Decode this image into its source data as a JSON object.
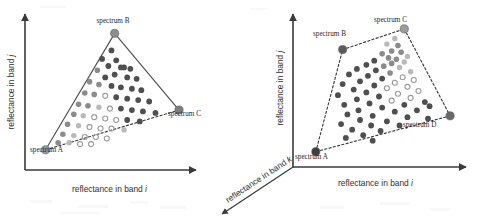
{
  "figure": {
    "background_color": "#ffffff",
    "axis_color": "#3a3a3a"
  },
  "panels": [
    {
      "id": "left",
      "name": "three-endmember-simplex",
      "axes": {
        "x_label_prefix": "reflectance in band ",
        "x_label_symbol": "i",
        "y_label_prefix": "reflectance in band ",
        "y_label_symbol": "j"
      },
      "endmembers": [
        {
          "label": "spectrum A",
          "x": 0.08,
          "y": 0.1,
          "color": "#9a9a9a"
        },
        {
          "label": "spectrum B",
          "x": 0.52,
          "y": 0.92,
          "color": "#8d8d8d"
        },
        {
          "label": "spectrum C",
          "x": 0.93,
          "y": 0.38,
          "color": "#7e7e7e"
        }
      ],
      "edge_style": [
        "solid",
        "solid",
        "dashed"
      ],
      "point_count": 55
    },
    {
      "id": "right",
      "name": "four-endmember-simplex",
      "axes": {
        "x_label_prefix": "reflectance in band ",
        "x_label_symbol": "i",
        "y_label_prefix": "reflectance in band ",
        "y_label_symbol": "j",
        "z_label_prefix": "reflectance in band ",
        "z_label_symbol": "k"
      },
      "endmembers": [
        {
          "label": "spectrum A",
          "x": 0.1,
          "y": 0.06,
          "color": "#3f3f3f"
        },
        {
          "label": "spectrum B",
          "x": 0.27,
          "y": 0.8,
          "color": "#5c5c5c"
        },
        {
          "label": "spectrum C",
          "x": 0.66,
          "y": 0.95,
          "color": "#9c9c9c"
        },
        {
          "label": "spectrum D",
          "x": 0.95,
          "y": 0.32,
          "color": "#6a6a6a"
        }
      ],
      "edge_style": [
        "dashed",
        "dashed",
        "dashed",
        "dashed"
      ],
      "point_count": 62
    }
  ],
  "chart_data": {
    "type": "scatter",
    "subplots": [
      {
        "name": "three-endmember simplex",
        "xlabel": "reflectance in band i",
        "ylabel": "reflectance in band j",
        "xlim": [
          0,
          1
        ],
        "ylim": [
          0,
          1
        ],
        "grid": false,
        "legend": "none",
        "annotations": [
          "spectrum A",
          "spectrum B",
          "spectrum C"
        ],
        "vertices": [
          {
            "name": "spectrum A",
            "x": 0.08,
            "y": 0.1
          },
          {
            "name": "spectrum B",
            "x": 0.52,
            "y": 0.92
          },
          {
            "name": "spectrum C",
            "x": 0.93,
            "y": 0.38
          }
        ],
        "points": [
          {
            "x": 0.5,
            "y": 0.8,
            "shade": "dark"
          },
          {
            "x": 0.44,
            "y": 0.74,
            "shade": "dark"
          },
          {
            "x": 0.53,
            "y": 0.73,
            "shade": "dark"
          },
          {
            "x": 0.48,
            "y": 0.69,
            "shade": "dark"
          },
          {
            "x": 0.56,
            "y": 0.68,
            "shade": "dark"
          },
          {
            "x": 0.58,
            "y": 0.68,
            "shade": "dark"
          },
          {
            "x": 0.62,
            "y": 0.67,
            "shade": "dark"
          },
          {
            "x": 0.41,
            "y": 0.66,
            "shade": "mid"
          },
          {
            "x": 0.52,
            "y": 0.63,
            "shade": "dark"
          },
          {
            "x": 0.46,
            "y": 0.61,
            "shade": "dark"
          },
          {
            "x": 0.6,
            "y": 0.61,
            "shade": "dark"
          },
          {
            "x": 0.66,
            "y": 0.6,
            "shade": "dark"
          },
          {
            "x": 0.36,
            "y": 0.58,
            "shade": "mid"
          },
          {
            "x": 0.42,
            "y": 0.56,
            "shade": "mid"
          },
          {
            "x": 0.5,
            "y": 0.55,
            "shade": "dark"
          },
          {
            "x": 0.56,
            "y": 0.54,
            "shade": "dark"
          },
          {
            "x": 0.63,
            "y": 0.53,
            "shade": "dark"
          },
          {
            "x": 0.69,
            "y": 0.52,
            "shade": "dark"
          },
          {
            "x": 0.33,
            "y": 0.5,
            "shade": "mid"
          },
          {
            "x": 0.39,
            "y": 0.49,
            "shade": "mid"
          },
          {
            "x": 0.46,
            "y": 0.48,
            "shade": "open"
          },
          {
            "x": 0.53,
            "y": 0.47,
            "shade": "dark"
          },
          {
            "x": 0.6,
            "y": 0.46,
            "shade": "dark"
          },
          {
            "x": 0.67,
            "y": 0.45,
            "shade": "dark"
          },
          {
            "x": 0.74,
            "y": 0.44,
            "shade": "dark"
          },
          {
            "x": 0.29,
            "y": 0.42,
            "shade": "mid"
          },
          {
            "x": 0.35,
            "y": 0.41,
            "shade": "mid"
          },
          {
            "x": 0.42,
            "y": 0.4,
            "shade": "light"
          },
          {
            "x": 0.49,
            "y": 0.39,
            "shade": "open"
          },
          {
            "x": 0.56,
            "y": 0.39,
            "shade": "dark"
          },
          {
            "x": 0.63,
            "y": 0.38,
            "shade": "dark"
          },
          {
            "x": 0.7,
            "y": 0.37,
            "shade": "dark"
          },
          {
            "x": 0.78,
            "y": 0.36,
            "shade": "dark"
          },
          {
            "x": 0.26,
            "y": 0.35,
            "shade": "mid"
          },
          {
            "x": 0.32,
            "y": 0.34,
            "shade": "light"
          },
          {
            "x": 0.39,
            "y": 0.33,
            "shade": "open"
          },
          {
            "x": 0.46,
            "y": 0.32,
            "shade": "open"
          },
          {
            "x": 0.53,
            "y": 0.31,
            "shade": "open"
          },
          {
            "x": 0.6,
            "y": 0.31,
            "shade": "dark"
          },
          {
            "x": 0.68,
            "y": 0.3,
            "shade": "dark"
          },
          {
            "x": 0.22,
            "y": 0.28,
            "shade": "mid"
          },
          {
            "x": 0.29,
            "y": 0.27,
            "shade": "light"
          },
          {
            "x": 0.36,
            "y": 0.26,
            "shade": "open"
          },
          {
            "x": 0.43,
            "y": 0.25,
            "shade": "open"
          },
          {
            "x": 0.5,
            "y": 0.25,
            "shade": "open"
          },
          {
            "x": 0.58,
            "y": 0.24,
            "shade": "light"
          },
          {
            "x": 0.19,
            "y": 0.21,
            "shade": "mid"
          },
          {
            "x": 0.26,
            "y": 0.2,
            "shade": "light"
          },
          {
            "x": 0.33,
            "y": 0.19,
            "shade": "open"
          },
          {
            "x": 0.4,
            "y": 0.19,
            "shade": "open"
          },
          {
            "x": 0.47,
            "y": 0.18,
            "shade": "open"
          },
          {
            "x": 0.16,
            "y": 0.15,
            "shade": "mid"
          },
          {
            "x": 0.23,
            "y": 0.15,
            "shade": "light"
          },
          {
            "x": 0.3,
            "y": 0.14,
            "shade": "open"
          },
          {
            "x": 0.37,
            "y": 0.14,
            "shade": "open"
          }
        ]
      },
      {
        "name": "four-endmember simplex",
        "xlabel": "reflectance in band i",
        "ylabel": "reflectance in band j",
        "zlabel": "reflectance in band k",
        "xlim": [
          0,
          1
        ],
        "ylim": [
          0,
          1
        ],
        "grid": false,
        "legend": "none",
        "annotations": [
          "spectrum A",
          "spectrum B",
          "spectrum C",
          "spectrum D"
        ],
        "vertices": [
          {
            "name": "spectrum A",
            "x": 0.1,
            "y": 0.06
          },
          {
            "name": "spectrum B",
            "x": 0.27,
            "y": 0.8
          },
          {
            "name": "spectrum C",
            "x": 0.66,
            "y": 0.95
          },
          {
            "name": "spectrum D",
            "x": 0.95,
            "y": 0.32
          }
        ],
        "points": [
          {
            "x": 0.6,
            "y": 0.88,
            "shade": "light"
          },
          {
            "x": 0.55,
            "y": 0.84,
            "shade": "light"
          },
          {
            "x": 0.62,
            "y": 0.83,
            "shade": "mid"
          },
          {
            "x": 0.58,
            "y": 0.79,
            "shade": "mid"
          },
          {
            "x": 0.64,
            "y": 0.78,
            "shade": "mid"
          },
          {
            "x": 0.52,
            "y": 0.77,
            "shade": "mid"
          },
          {
            "x": 0.68,
            "y": 0.75,
            "shade": "light"
          },
          {
            "x": 0.56,
            "y": 0.74,
            "shade": "mid"
          },
          {
            "x": 0.61,
            "y": 0.73,
            "shade": "mid"
          },
          {
            "x": 0.47,
            "y": 0.72,
            "shade": "dark"
          },
          {
            "x": 0.66,
            "y": 0.71,
            "shade": "light"
          },
          {
            "x": 0.58,
            "y": 0.7,
            "shade": "mid"
          },
          {
            "x": 0.42,
            "y": 0.69,
            "shade": "dark"
          },
          {
            "x": 0.53,
            "y": 0.68,
            "shade": "mid"
          },
          {
            "x": 0.63,
            "y": 0.67,
            "shade": "light"
          },
          {
            "x": 0.36,
            "y": 0.66,
            "shade": "dark"
          },
          {
            "x": 0.48,
            "y": 0.65,
            "shade": "dark"
          },
          {
            "x": 0.7,
            "y": 0.64,
            "shade": "light"
          },
          {
            "x": 0.57,
            "y": 0.63,
            "shade": "mid"
          },
          {
            "x": 0.31,
            "y": 0.62,
            "shade": "dark"
          },
          {
            "x": 0.43,
            "y": 0.61,
            "shade": "dark"
          },
          {
            "x": 0.65,
            "y": 0.6,
            "shade": "open"
          },
          {
            "x": 0.52,
            "y": 0.59,
            "shade": "dark"
          },
          {
            "x": 0.72,
            "y": 0.58,
            "shade": "open"
          },
          {
            "x": 0.38,
            "y": 0.57,
            "shade": "dark"
          },
          {
            "x": 0.6,
            "y": 0.56,
            "shade": "open"
          },
          {
            "x": 0.27,
            "y": 0.55,
            "shade": "dark"
          },
          {
            "x": 0.47,
            "y": 0.54,
            "shade": "dark"
          },
          {
            "x": 0.68,
            "y": 0.53,
            "shade": "open"
          },
          {
            "x": 0.55,
            "y": 0.52,
            "shade": "open"
          },
          {
            "x": 0.34,
            "y": 0.51,
            "shade": "dark"
          },
          {
            "x": 0.75,
            "y": 0.5,
            "shade": "open"
          },
          {
            "x": 0.42,
            "y": 0.49,
            "shade": "dark"
          },
          {
            "x": 0.62,
            "y": 0.48,
            "shade": "open"
          },
          {
            "x": 0.24,
            "y": 0.47,
            "shade": "dark"
          },
          {
            "x": 0.5,
            "y": 0.46,
            "shade": "dark"
          },
          {
            "x": 0.7,
            "y": 0.45,
            "shade": "open"
          },
          {
            "x": 0.36,
            "y": 0.44,
            "shade": "dark"
          },
          {
            "x": 0.58,
            "y": 0.43,
            "shade": "open"
          },
          {
            "x": 0.79,
            "y": 0.42,
            "shade": "dark"
          },
          {
            "x": 0.44,
            "y": 0.41,
            "shade": "dark"
          },
          {
            "x": 0.28,
            "y": 0.4,
            "shade": "dark"
          },
          {
            "x": 0.66,
            "y": 0.4,
            "shade": "dark"
          },
          {
            "x": 0.82,
            "y": 0.39,
            "shade": "dark"
          },
          {
            "x": 0.52,
            "y": 0.38,
            "shade": "dark"
          },
          {
            "x": 0.37,
            "y": 0.36,
            "shade": "dark"
          },
          {
            "x": 0.74,
            "y": 0.36,
            "shade": "dark"
          },
          {
            "x": 0.6,
            "y": 0.35,
            "shade": "dark"
          },
          {
            "x": 0.3,
            "y": 0.33,
            "shade": "dark"
          },
          {
            "x": 0.46,
            "y": 0.32,
            "shade": "dark"
          },
          {
            "x": 0.68,
            "y": 0.31,
            "shade": "dark"
          },
          {
            "x": 0.81,
            "y": 0.3,
            "shade": "dark"
          },
          {
            "x": 0.38,
            "y": 0.29,
            "shade": "dark"
          },
          {
            "x": 0.55,
            "y": 0.28,
            "shade": "dark"
          },
          {
            "x": 0.26,
            "y": 0.26,
            "shade": "dark"
          },
          {
            "x": 0.45,
            "y": 0.25,
            "shade": "dark"
          },
          {
            "x": 0.63,
            "y": 0.25,
            "shade": "dark"
          },
          {
            "x": 0.33,
            "y": 0.22,
            "shade": "dark"
          },
          {
            "x": 0.51,
            "y": 0.21,
            "shade": "dark"
          },
          {
            "x": 0.4,
            "y": 0.18,
            "shade": "dark"
          },
          {
            "x": 0.29,
            "y": 0.16,
            "shade": "dark"
          },
          {
            "x": 0.46,
            "y": 0.14,
            "shade": "dark"
          }
        ]
      }
    ]
  },
  "palette": {
    "dark": "#4f4f4f",
    "mid": "#8b8b8b",
    "light": "#b9b9b9",
    "open_stroke": "#9a9a9a",
    "vertex": "#6e6e6e",
    "axis": "#3a3a3a"
  }
}
